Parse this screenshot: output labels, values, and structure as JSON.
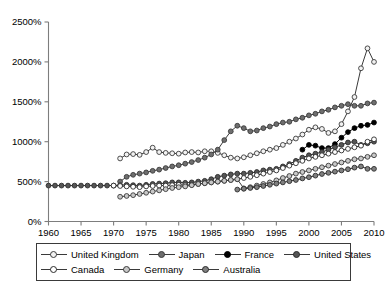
{
  "chart_data": {
    "type": "line",
    "title": "",
    "subtitle": "",
    "xlabel": "",
    "ylabel": "",
    "xlim": [
      1960,
      2010
    ],
    "ylim": [
      0,
      2500
    ],
    "grid": false,
    "legend_position": "bottom",
    "x_ticks": [
      "1960",
      "1965",
      "1970",
      "1975",
      "1980",
      "1985",
      "1990",
      "1995",
      "2000",
      "2005",
      "2010"
    ],
    "y_ticks": [
      "0%",
      "500%",
      "1000%",
      "1500%",
      "2000%",
      "2500%"
    ],
    "y_tick_values": [
      0,
      500,
      1000,
      1500,
      2000,
      2500
    ],
    "x_tick_values": [
      1960,
      1965,
      1970,
      1975,
      1980,
      1985,
      1990,
      1995,
      2000,
      2005,
      2010
    ],
    "series": [
      {
        "name": "United Kingdom",
        "marker": "open-circle",
        "marker_fill": "#f2f2f2",
        "line_color": "#3a3a3a",
        "x": [
          1971,
          1972,
          1973,
          1974,
          1975,
          1976,
          1977,
          1978,
          1979,
          1980,
          1981,
          1982,
          1983,
          1984,
          1985,
          1986,
          1987,
          1988,
          1989,
          1990,
          1991,
          1992,
          1993,
          1994,
          1995,
          1996,
          1997,
          1998,
          1999,
          2000,
          2001,
          2002,
          2003,
          2004,
          2005,
          2006,
          2007,
          2008,
          2009,
          2010
        ],
        "values": [
          790,
          840,
          845,
          835,
          870,
          925,
          870,
          860,
          855,
          850,
          865,
          870,
          865,
          880,
          880,
          860,
          830,
          800,
          790,
          805,
          830,
          855,
          880,
          900,
          920,
          960,
          1000,
          1040,
          1090,
          1150,
          1180,
          1160,
          1110,
          1130,
          1220,
          1380,
          1560,
          1920,
          2170,
          2000
        ]
      },
      {
        "name": "Japan",
        "marker": "filled-circle",
        "marker_fill": "#6e6e6e",
        "line_color": "#3a3a3a",
        "x": [
          1971,
          1972,
          1973,
          1974,
          1975,
          1976,
          1977,
          1978,
          1979,
          1980,
          1981,
          1982,
          1983,
          1984,
          1985,
          1986,
          1987,
          1988,
          1989,
          1990,
          1991,
          1992,
          1993,
          1994,
          1995,
          1996,
          1997,
          1998,
          1999,
          2000,
          2001,
          2002,
          2003,
          2004,
          2005,
          2006,
          2007,
          2008,
          2009,
          2010
        ],
        "values": [
          500,
          560,
          585,
          600,
          615,
          635,
          650,
          670,
          690,
          705,
          725,
          745,
          770,
          800,
          840,
          900,
          1020,
          1130,
          1200,
          1170,
          1130,
          1140,
          1170,
          1190,
          1220,
          1240,
          1250,
          1280,
          1300,
          1330,
          1350,
          1380,
          1400,
          1430,
          1450,
          1470,
          1450,
          1450,
          1480,
          1490
        ]
      },
      {
        "name": "France",
        "marker": "filled-circle",
        "marker_fill": "#000000",
        "line_color": "#000000",
        "x": [
          1999,
          2000,
          2001,
          2002,
          2003,
          2004,
          2005,
          2006,
          2007,
          2008,
          2009,
          2010
        ],
        "values": [
          900,
          960,
          950,
          920,
          920,
          970,
          1050,
          1120,
          1170,
          1200,
          1210,
          1240
        ]
      },
      {
        "name": "United States",
        "marker": "filled-circle",
        "marker_fill": "#555555",
        "line_color": "#2b2b2b",
        "x": [
          1960,
          1961,
          1962,
          1963,
          1964,
          1965,
          1966,
          1967,
          1968,
          1969,
          1970,
          1971,
          1972,
          1973,
          1974,
          1975,
          1976,
          1977,
          1978,
          1979,
          1980,
          1981,
          1982,
          1983,
          1984,
          1985,
          1986,
          1987,
          1988,
          1989,
          1990,
          1991,
          1992,
          1993,
          1994,
          1995,
          1996,
          1997,
          1998,
          1999,
          2000,
          2001,
          2002,
          2003,
          2004,
          2005,
          2006,
          2007,
          2008,
          2009,
          2010
        ],
        "values": [
          450,
          450,
          450,
          450,
          450,
          450,
          450,
          450,
          450,
          450,
          450,
          455,
          460,
          455,
          450,
          460,
          470,
          475,
          480,
          490,
          490,
          485,
          490,
          500,
          510,
          530,
          560,
          575,
          590,
          600,
          600,
          610,
          620,
          640,
          650,
          660,
          690,
          720,
          760,
          800,
          830,
          850,
          870,
          900,
          930,
          960,
          990,
          1000,
          960,
          980,
          1000
        ]
      },
      {
        "name": "Canada",
        "marker": "open-circle",
        "marker_fill": "#ffffff",
        "line_color": "#2b2b2b",
        "x": [
          1970,
          1971,
          1972,
          1973,
          1974,
          1975,
          1976,
          1977,
          1978,
          1979,
          1980,
          1981,
          1982,
          1983,
          1984,
          1985,
          1986,
          1987,
          1988,
          1989,
          1990,
          1991,
          1992,
          1993,
          1994,
          1995,
          1996,
          1997,
          1998,
          1999,
          2000,
          2001,
          2002,
          2003,
          2004,
          2005,
          2006,
          2007,
          2008,
          2009,
          2010
        ],
        "values": [
          450,
          445,
          440,
          435,
          430,
          440,
          445,
          450,
          450,
          455,
          460,
          455,
          460,
          470,
          480,
          490,
          500,
          510,
          520,
          530,
          545,
          560,
          580,
          600,
          620,
          640,
          670,
          700,
          730,
          760,
          790,
          810,
          830,
          850,
          870,
          890,
          910,
          930,
          950,
          1000,
          1030
        ]
      },
      {
        "name": "Germany",
        "marker": "filled-circle",
        "marker_fill": "#c8c8c8",
        "line_color": "#3a3a3a",
        "x": [
          1971,
          1972,
          1973,
          1974,
          1975,
          1976,
          1977,
          1978,
          1979,
          1980,
          1981,
          1982,
          1983,
          1984,
          1985,
          1986,
          1987,
          1988,
          1989,
          1990,
          1991,
          1992,
          1993,
          1994,
          1995,
          1996,
          1997,
          1998,
          1999,
          2000,
          2001,
          2002,
          2003,
          2004,
          2005,
          2006,
          2007,
          2008,
          2009,
          2010
        ],
        "values": [
          310,
          320,
          330,
          345,
          360,
          375,
          390,
          405,
          420,
          430,
          440,
          455,
          470,
          480,
          490,
          500,
          510,
          520,
          530,
          415,
          430,
          450,
          470,
          490,
          515,
          545,
          570,
          600,
          620,
          640,
          660,
          680,
          700,
          720,
          740,
          760,
          780,
          790,
          810,
          830
        ]
      },
      {
        "name": "Australia",
        "marker": "filled-circle",
        "marker_fill": "#808080",
        "line_color": "#2b2b2b",
        "x": [
          1989,
          1990,
          1991,
          1992,
          1993,
          1994,
          1995,
          1996,
          1997,
          1998,
          1999,
          2000,
          2001,
          2002,
          2003,
          2004,
          2005,
          2006,
          2007,
          2008,
          2009,
          2010
        ],
        "values": [
          400,
          410,
          420,
          430,
          445,
          460,
          475,
          490,
          505,
          520,
          540,
          555,
          575,
          595,
          610,
          625,
          640,
          655,
          675,
          690,
          660,
          660
        ]
      }
    ]
  },
  "legend": {
    "rows": [
      [
        {
          "label": "United Kingdom",
          "swatch": "open-circle-marker"
        },
        {
          "label": "Japan",
          "swatch": "gray-circle-marker"
        },
        {
          "label": "France",
          "swatch": "black-circle-marker"
        },
        {
          "label": "United States",
          "swatch": "dark-gray-circle-marker"
        }
      ],
      [
        {
          "label": "Canada",
          "swatch": "white-circle-marker"
        },
        {
          "label": "Germany",
          "swatch": "light-gray-circle-marker"
        },
        {
          "label": "Australia",
          "swatch": "medium-gray-circle-marker"
        }
      ]
    ]
  }
}
